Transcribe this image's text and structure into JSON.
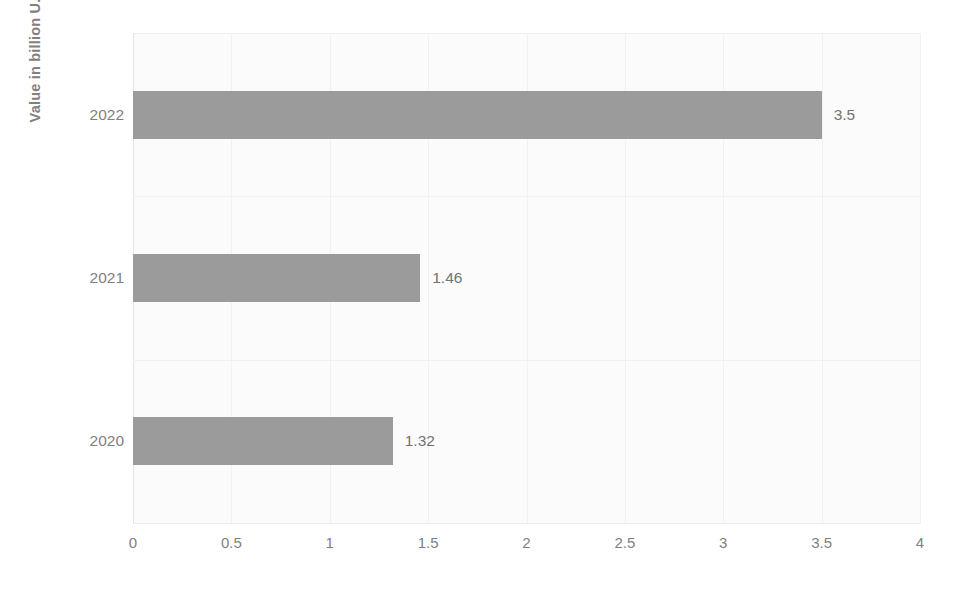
{
  "chart_data": {
    "type": "bar",
    "orientation": "horizontal",
    "title": "",
    "xlabel": "",
    "ylabel": "Value in billion U.S dillors",
    "categories": [
      "2022",
      "2021",
      "2020"
    ],
    "values": [
      3.5,
      1.46,
      1.32
    ],
    "data_labels": [
      "3.5",
      "1.46",
      "1.32"
    ],
    "xlim": [
      0,
      4
    ],
    "xticks": [
      0,
      0.5,
      1,
      1.5,
      2,
      2.5,
      3,
      3.5,
      4
    ],
    "xtick_labels": [
      "0",
      "0.5",
      "1",
      "1.5",
      "2",
      "2.5",
      "3",
      "3.5",
      "4"
    ],
    "grid": true,
    "legend": false,
    "series": [
      {
        "name": "Value in billion U.S dillors",
        "values": [
          3.5,
          1.46,
          1.32
        ]
      }
    ],
    "colors": {
      "bar": "#9b9b9b",
      "text": "#7f7f7f",
      "plot_background": "#fbfbfb",
      "gridline": "#f1f1f1",
      "page_background": "#ffffff"
    }
  }
}
